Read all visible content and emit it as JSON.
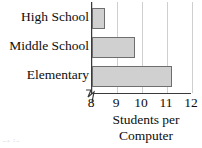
{
  "chart_data": {
    "type": "bar",
    "orientation": "horizontal",
    "title": "",
    "xlabel": "Students per Computer",
    "xlabel_lines": [
      "Students per",
      "Computer"
    ],
    "ylabel": "",
    "categories": [
      "High School",
      "Middle School",
      "Elementary"
    ],
    "values": [
      8.5,
      9.7,
      11.2
    ],
    "xlim": [
      8,
      12
    ],
    "xticks": [
      8,
      9,
      10,
      11,
      12
    ],
    "xtick_labels": [
      "8",
      "9",
      "10",
      "11",
      "12"
    ],
    "axis_break": true,
    "grid": true,
    "grid_axis": "x",
    "legend": null,
    "bar_fill": "#d0d0d0",
    "bar_edge": "#6e6e6e",
    "grid_color": "#cfcfcf",
    "axis_color": "#3a3a3a"
  },
  "page_remnant": "at is"
}
